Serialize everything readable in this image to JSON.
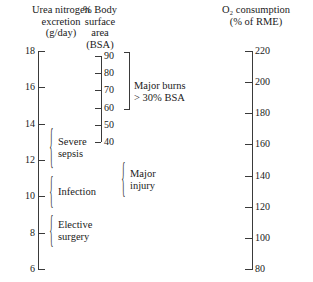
{
  "chart_data": {
    "type": "table",
    "grid": false,
    "legend": false,
    "axes": [
      {
        "id": "urea",
        "header": "Urea nitrogen\nexcretion\n(g/day)",
        "label": "Urea nitrogen excretion",
        "units": "g/day",
        "tick_labels": [
          "18",
          "16",
          "14",
          "12",
          "10",
          "8",
          "6"
        ],
        "values": [
          18,
          16,
          14,
          12,
          10,
          8,
          6
        ],
        "range": [
          6,
          18
        ],
        "step": 2,
        "tick_side": "right",
        "label_side": "left"
      },
      {
        "id": "bsa",
        "header": "% Body\nsurface\narea\n(BSA)",
        "label": "% Body surface area",
        "units": "BSA",
        "tick_labels": [
          "90",
          "80",
          "70",
          "60",
          "50",
          "40"
        ],
        "values": [
          90,
          80,
          70,
          60,
          50,
          40
        ],
        "range": [
          40,
          90
        ],
        "step": 10,
        "tick_side": "left",
        "label_side": "right"
      },
      {
        "id": "o2",
        "header": "O₂ consumption\n(% of RME)",
        "label": "O₂ consumption",
        "units": "% of RME",
        "tick_labels": [
          "220",
          "200",
          "180",
          "160",
          "140",
          "120",
          "100",
          "80"
        ],
        "values": [
          220,
          200,
          180,
          160,
          140,
          120,
          100,
          80
        ],
        "range": [
          80,
          220
        ],
        "step": 20,
        "tick_side": "right",
        "label_side": "right"
      }
    ],
    "annotations": [
      {
        "id": "major-burns",
        "label": "Major burns\n> 30% BSA",
        "axis": "bsa",
        "span_values": [
          40,
          90
        ]
      },
      {
        "id": "severe-sepsis",
        "label": "Severe\nsepsis",
        "axis": "urea",
        "span_values": [
          11.3,
          14.0
        ]
      },
      {
        "id": "major-injury",
        "label": "Major\ninjury",
        "axis": "urea",
        "span_values": [
          9.0,
          11.3
        ]
      },
      {
        "id": "infection",
        "label": "Infection",
        "axis": "urea",
        "span_values": [
          9.0,
          11.3
        ]
      },
      {
        "id": "elective-surgery",
        "label": "Elective\nsurgery",
        "axis": "urea",
        "span_values": [
          7.0,
          9.0
        ]
      }
    ]
  },
  "headers": {
    "urea": "Urea nitrogen\nexcretion\n(g/day)",
    "bsa": "% Body\nsurface\narea\n(BSA)",
    "o2": "O₂ consumption\n(% of RME)"
  },
  "urea_ticks": [
    {
      "label": "18"
    },
    {
      "label": "16"
    },
    {
      "label": "14"
    },
    {
      "label": "12"
    },
    {
      "label": "10"
    },
    {
      "label": "8"
    },
    {
      "label": "6"
    }
  ],
  "bsa_ticks": [
    {
      "label": "90"
    },
    {
      "label": "80"
    },
    {
      "label": "70"
    },
    {
      "label": "60"
    },
    {
      "label": "50"
    },
    {
      "label": "40"
    }
  ],
  "o2_ticks": [
    {
      "label": "220"
    },
    {
      "label": "200"
    },
    {
      "label": "180"
    },
    {
      "label": "160"
    },
    {
      "label": "140"
    },
    {
      "label": "120"
    },
    {
      "label": "100"
    },
    {
      "label": "80"
    }
  ],
  "annotations": {
    "major_burns": "Major burns\n> 30% BSA",
    "severe_sepsis": "Severe\nsepsis",
    "infection": "Infection",
    "elective_surgery": "Elective\nsurgery",
    "major_injury": "Major\ninjury"
  },
  "colors": {
    "ink": "#1a1a1a",
    "rule": "#3a3a3a",
    "background": "#ffffff"
  }
}
